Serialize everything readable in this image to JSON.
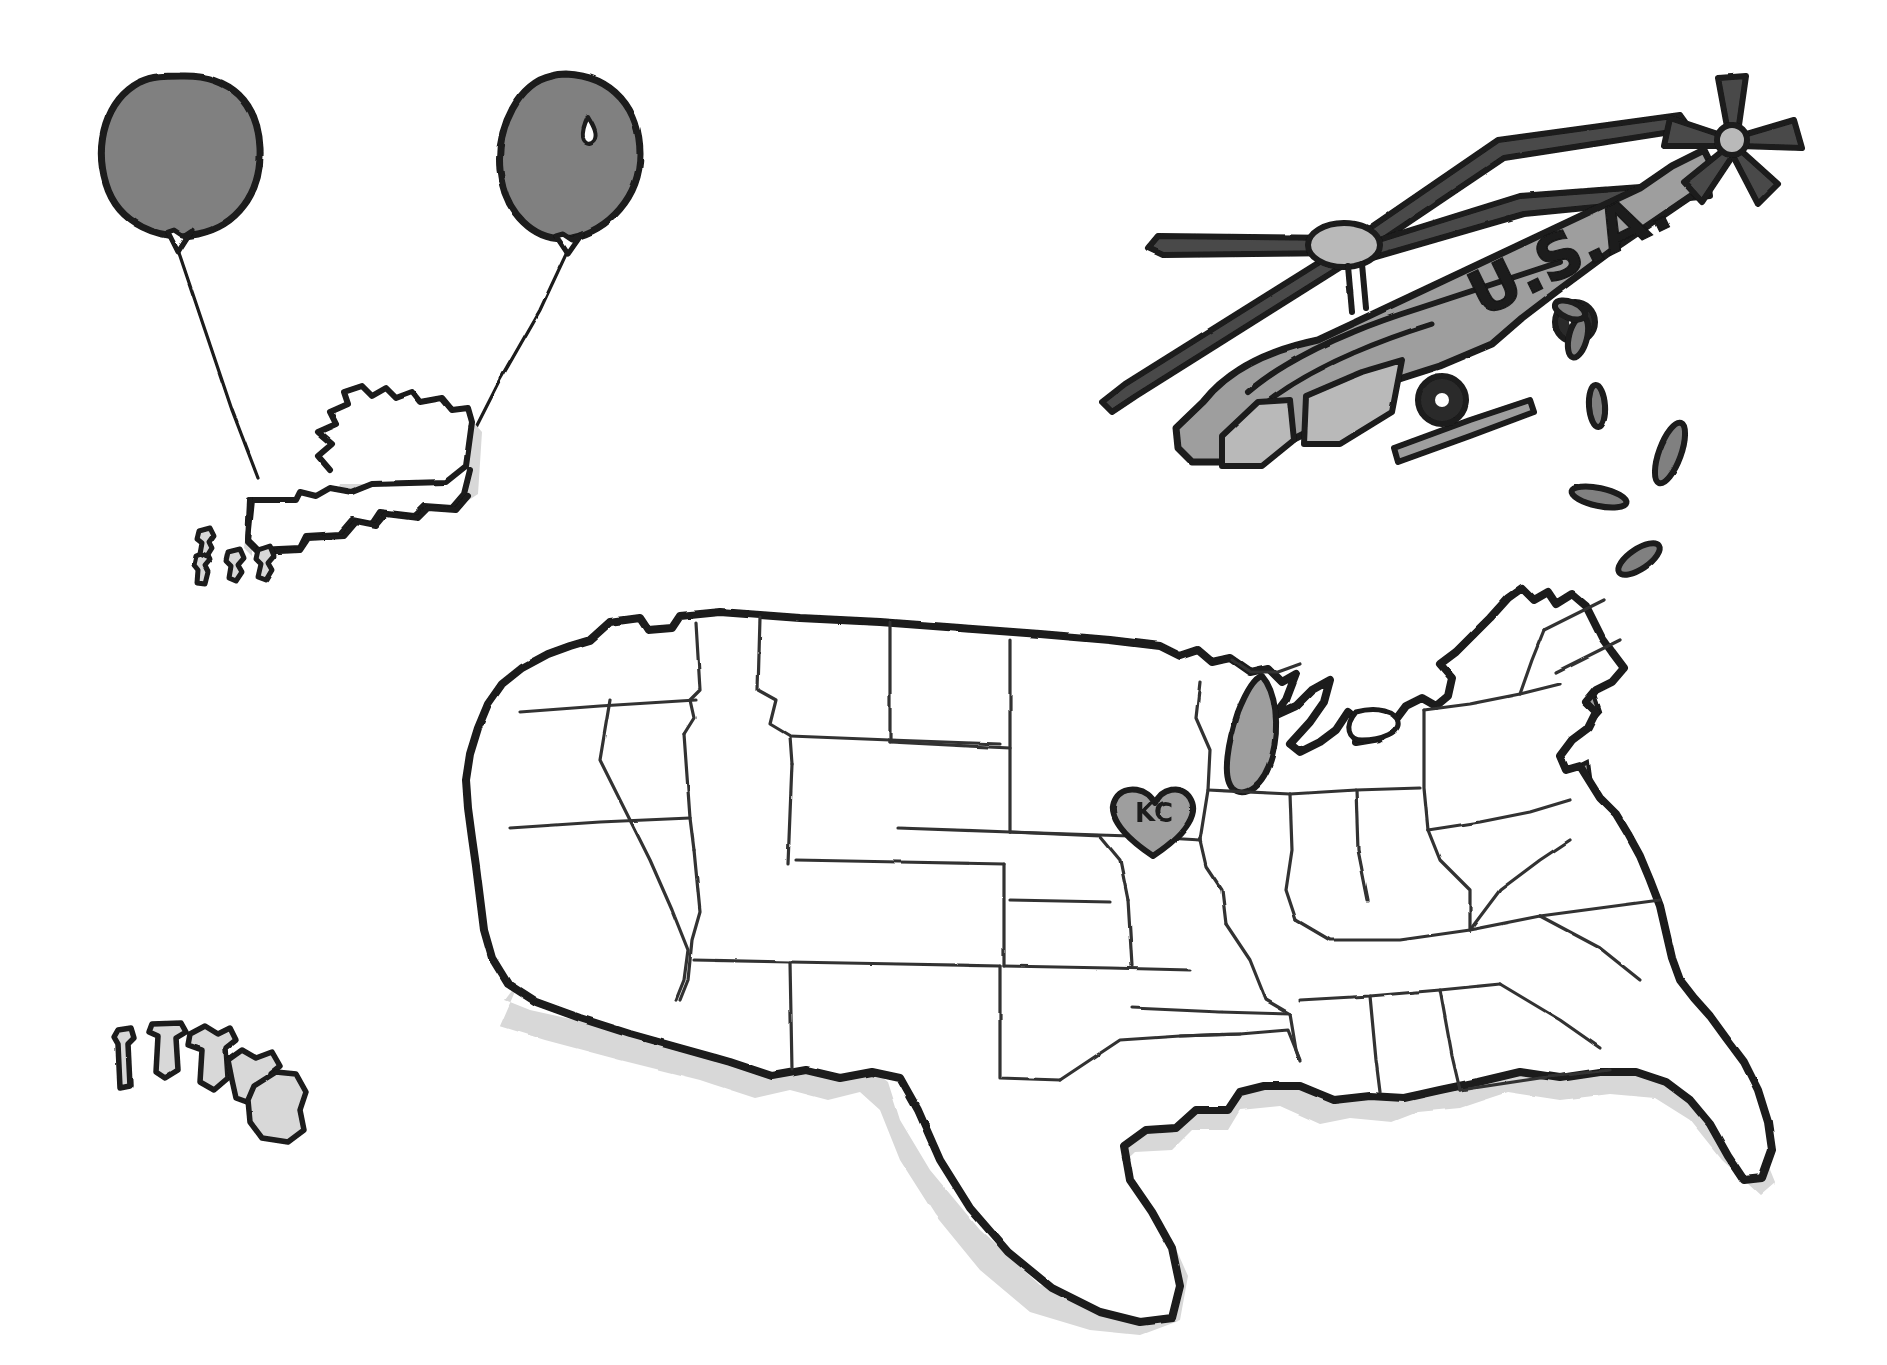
{
  "illustration": {
    "title": "United States map with helicopter, balloons and Kansas City heart",
    "background_color": "#ffffff",
    "ink_color": "#1a1a1a",
    "mid_gray": "#808080",
    "body_gray": "#9e9e9e",
    "light_gray": "#d8d8d8",
    "window_gray": "#b9b9b9",
    "dark_gray": "#4a4a4a"
  },
  "balloons": {
    "name": "balloon-pair",
    "count": 2,
    "fill_color": "#808080",
    "outline_color": "#1a1a1a",
    "items": [
      {
        "id": "balloon-left",
        "cx": 180,
        "cy": 160,
        "rx": 78,
        "ry": 82,
        "has_highlight": false
      },
      {
        "id": "balloon-right",
        "cx": 570,
        "cy": 155,
        "rx": 66,
        "ry": 80,
        "has_highlight": true
      }
    ],
    "strings": [
      {
        "id": "balloon-string-left",
        "from_x": 178,
        "from_y": 248,
        "to_x": 258,
        "to_y": 478
      },
      {
        "id": "balloon-string-right",
        "from_x": 568,
        "from_y": 248,
        "to_x": 468,
        "to_y": 443
      }
    ]
  },
  "alaska": {
    "name": "alaska-inset",
    "label": "Alaska",
    "fill_color": "#ffffff",
    "shadow_color": "#d8d8d8",
    "outline_color": "#1a1a1a",
    "aleutian_island_count": 4
  },
  "hawaii": {
    "name": "hawaii-inset",
    "label": "Hawaii",
    "fill_color": "#d8d8d8",
    "outline_color": "#1a1a1a",
    "island_count": 5
  },
  "helicopter": {
    "name": "helicopter",
    "fuselage_text": "U.S.A.",
    "fuselage_color": "#9e9e9e",
    "window_color": "#b9b9b9",
    "blade_color": "#4a4a4a",
    "outline_color": "#1a1a1a",
    "main_rotor_blades": 4,
    "tail_rotor_blades": 5,
    "wheel_count": 2,
    "dropped_object_count": 6,
    "dropped_object_color": "#808080"
  },
  "usa_map": {
    "name": "usa-map",
    "fill_color": "#ffffff",
    "outline_color": "#1a1a1a",
    "coast_shadow_color": "#d8d8d8",
    "state_border_color": "#333333",
    "marker": {
      "name": "kansas-city-heart-marker",
      "label": "KC",
      "fill_color": "#9e9e9e",
      "outline_color": "#1a1a1a",
      "x": 1155,
      "y": 818
    }
  }
}
